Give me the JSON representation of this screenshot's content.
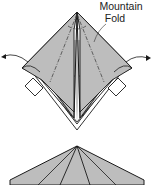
{
  "diagram": {
    "type": "origami-instructions",
    "step_top": {
      "annotation_line1": "Mountain",
      "annotation_line2": "Fold",
      "fill_color": "#bdbdbd",
      "stroke_color": "#1a1a1a"
    },
    "step_bottom": {
      "fill_color": "#bdbdbd",
      "stroke_color": "#1a1a1a"
    }
  }
}
